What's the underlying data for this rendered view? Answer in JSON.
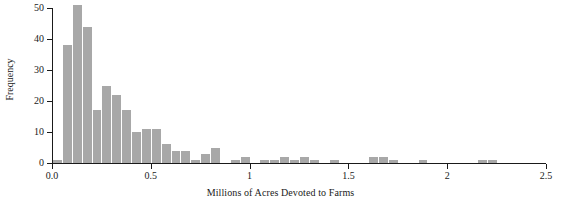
{
  "chart_data": {
    "type": "bar",
    "title": "",
    "subtitle": "",
    "xlabel": "Millions of Acres Devoted to Farms",
    "ylabel": "Frequency",
    "grid": false,
    "legend": null,
    "xlim": [
      0.0,
      2.5
    ],
    "ylim": [
      0,
      50
    ],
    "bin_width": 0.05,
    "x_ticks": [
      {
        "value": 0.0,
        "label": "0.0"
      },
      {
        "value": 0.5,
        "label": "0.5"
      },
      {
        "value": 1.0,
        "label": "1"
      },
      {
        "value": 1.5,
        "label": "1.5"
      },
      {
        "value": 2.0,
        "label": "2"
      },
      {
        "value": 2.5,
        "label": "2.5"
      }
    ],
    "y_ticks": [
      {
        "value": 0,
        "label": "0"
      },
      {
        "value": 10,
        "label": "10"
      },
      {
        "value": 20,
        "label": "20"
      },
      {
        "value": 30,
        "label": "30"
      },
      {
        "value": 40,
        "label": "40"
      },
      {
        "value": 50,
        "label": "50"
      }
    ],
    "bar_color": "#a8a8a8",
    "axis_color": "#1a1a1a",
    "bins": [
      {
        "x0": 0.0,
        "x1": 0.05,
        "value": 1
      },
      {
        "x0": 0.05,
        "x1": 0.1,
        "value": 38
      },
      {
        "x0": 0.1,
        "x1": 0.15,
        "value": 51
      },
      {
        "x0": 0.15,
        "x1": 0.2,
        "value": 44
      },
      {
        "x0": 0.2,
        "x1": 0.25,
        "value": 17
      },
      {
        "x0": 0.25,
        "x1": 0.3,
        "value": 25
      },
      {
        "x0": 0.3,
        "x1": 0.35,
        "value": 22
      },
      {
        "x0": 0.35,
        "x1": 0.4,
        "value": 17
      },
      {
        "x0": 0.4,
        "x1": 0.45,
        "value": 10
      },
      {
        "x0": 0.45,
        "x1": 0.5,
        "value": 11
      },
      {
        "x0": 0.5,
        "x1": 0.55,
        "value": 11
      },
      {
        "x0": 0.55,
        "x1": 0.6,
        "value": 6
      },
      {
        "x0": 0.6,
        "x1": 0.65,
        "value": 4
      },
      {
        "x0": 0.65,
        "x1": 0.7,
        "value": 4
      },
      {
        "x0": 0.7,
        "x1": 0.75,
        "value": 1
      },
      {
        "x0": 0.75,
        "x1": 0.8,
        "value": 3
      },
      {
        "x0": 0.8,
        "x1": 0.85,
        "value": 5
      },
      {
        "x0": 0.85,
        "x1": 0.9,
        "value": 0
      },
      {
        "x0": 0.9,
        "x1": 0.95,
        "value": 1
      },
      {
        "x0": 0.95,
        "x1": 1.0,
        "value": 2
      },
      {
        "x0": 1.0,
        "x1": 1.05,
        "value": 0
      },
      {
        "x0": 1.05,
        "x1": 1.1,
        "value": 1
      },
      {
        "x0": 1.1,
        "x1": 1.15,
        "value": 1
      },
      {
        "x0": 1.15,
        "x1": 1.2,
        "value": 2
      },
      {
        "x0": 1.2,
        "x1": 1.25,
        "value": 1
      },
      {
        "x0": 1.25,
        "x1": 1.3,
        "value": 2
      },
      {
        "x0": 1.3,
        "x1": 1.35,
        "value": 1
      },
      {
        "x0": 1.35,
        "x1": 1.4,
        "value": 0
      },
      {
        "x0": 1.4,
        "x1": 1.45,
        "value": 1
      },
      {
        "x0": 1.45,
        "x1": 1.5,
        "value": 0
      },
      {
        "x0": 1.5,
        "x1": 1.55,
        "value": 0
      },
      {
        "x0": 1.55,
        "x1": 1.6,
        "value": 0
      },
      {
        "x0": 1.6,
        "x1": 1.65,
        "value": 2
      },
      {
        "x0": 1.65,
        "x1": 1.7,
        "value": 2
      },
      {
        "x0": 1.7,
        "x1": 1.75,
        "value": 1
      },
      {
        "x0": 1.75,
        "x1": 1.8,
        "value": 0
      },
      {
        "x0": 1.8,
        "x1": 1.85,
        "value": 0
      },
      {
        "x0": 1.85,
        "x1": 1.9,
        "value": 1
      },
      {
        "x0": 1.9,
        "x1": 1.95,
        "value": 0
      },
      {
        "x0": 1.95,
        "x1": 2.0,
        "value": 0
      },
      {
        "x0": 2.0,
        "x1": 2.05,
        "value": 0
      },
      {
        "x0": 2.05,
        "x1": 2.1,
        "value": 0
      },
      {
        "x0": 2.1,
        "x1": 2.15,
        "value": 0
      },
      {
        "x0": 2.15,
        "x1": 2.2,
        "value": 1
      },
      {
        "x0": 2.2,
        "x1": 2.25,
        "value": 1
      },
      {
        "x0": 2.25,
        "x1": 2.3,
        "value": 0
      },
      {
        "x0": 2.3,
        "x1": 2.35,
        "value": 0
      },
      {
        "x0": 2.35,
        "x1": 2.4,
        "value": 0
      },
      {
        "x0": 2.4,
        "x1": 2.45,
        "value": 0
      },
      {
        "x0": 2.45,
        "x1": 2.5,
        "value": 0
      }
    ]
  }
}
